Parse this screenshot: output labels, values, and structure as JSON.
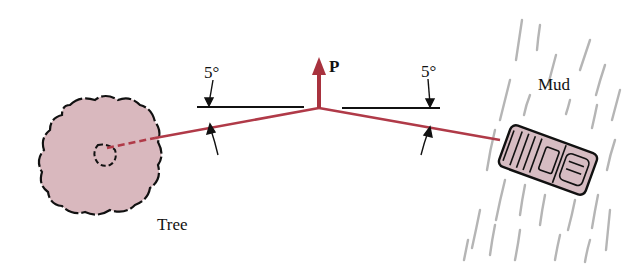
{
  "diagram": {
    "labels": {
      "tree": "Tree",
      "mud": "Mud",
      "force": "P",
      "angle_left": "5°",
      "angle_right": "5°"
    },
    "colors": {
      "rope": "#b03a48",
      "force_arrow": "#a8323e",
      "tree_fill": "#d9b8be",
      "car_fill": "#d6bcc2",
      "mud_marks": "#b5b5b5",
      "ink": "#111111"
    },
    "angles_deg": {
      "left": 5,
      "right": 5
    }
  }
}
